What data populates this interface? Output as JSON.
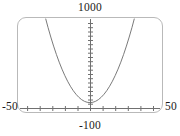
{
  "chart_data": {
    "type": "line",
    "title": "",
    "xlabel": "",
    "ylabel": "",
    "function": "y = x^2",
    "xlim": [
      -50,
      50
    ],
    "ylim": [
      -100,
      1000
    ],
    "grid": false,
    "legend": null,
    "axis_labels": {
      "top": "1000",
      "bottom": "-100",
      "left": "-50",
      "right": "50"
    },
    "tick_labels": {
      "x": [
        "-50",
        "50"
      ],
      "y": [
        "-100",
        "1000"
      ]
    },
    "x_tick_values": [
      -50,
      -40,
      -30,
      -20,
      -10,
      0,
      10,
      20,
      30,
      40,
      50
    ],
    "y_tick_values": [
      -100,
      -50,
      0,
      50,
      100,
      150,
      200,
      250,
      300,
      350,
      400,
      450,
      500,
      550,
      600,
      650,
      700,
      750,
      800,
      850,
      900,
      950,
      1000
    ],
    "series": [
      {
        "name": "y = x^2",
        "color": "#6b6b6b",
        "x": [
          -31.6,
          -30,
          -28,
          -26,
          -24,
          -22,
          -20,
          -18,
          -16,
          -14,
          -12,
          -10,
          -8,
          -6,
          -4,
          -2,
          0,
          2,
          4,
          6,
          8,
          10,
          12,
          14,
          16,
          18,
          20,
          22,
          24,
          26,
          28,
          30,
          31.6
        ],
        "values": [
          1000,
          900,
          784,
          676,
          576,
          484,
          400,
          324,
          256,
          196,
          144,
          100,
          64,
          36,
          16,
          4,
          0,
          4,
          16,
          36,
          64,
          100,
          144,
          196,
          256,
          324,
          400,
          484,
          576,
          676,
          784,
          900,
          1000
        ]
      }
    ],
    "colors": {
      "curve": "#6b6b6b",
      "axis": "#707070",
      "frame": "#b9b9b9",
      "text": "#1a1a1a",
      "background": "#ffffff"
    }
  }
}
